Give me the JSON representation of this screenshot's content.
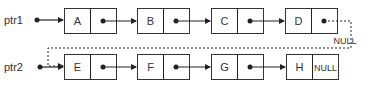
{
  "diagram": {
    "type": "linked-list",
    "lists": [
      {
        "pointer": "ptr1",
        "nodes": [
          {
            "value": "A",
            "next": "pointer"
          },
          {
            "value": "B",
            "next": "pointer"
          },
          {
            "value": "C",
            "next": "pointer"
          },
          {
            "value": "D",
            "next": "pointer",
            "dashed_next": "E",
            "null_label": "NULL"
          }
        ]
      },
      {
        "pointer": "ptr2",
        "nodes": [
          {
            "value": "E",
            "next": "pointer"
          },
          {
            "value": "F",
            "next": "pointer"
          },
          {
            "value": "G",
            "next": "pointer"
          },
          {
            "value": "H",
            "next": "NULL"
          }
        ]
      }
    ],
    "colors": {
      "stroke": "#333333",
      "background": "#ffffff"
    }
  }
}
